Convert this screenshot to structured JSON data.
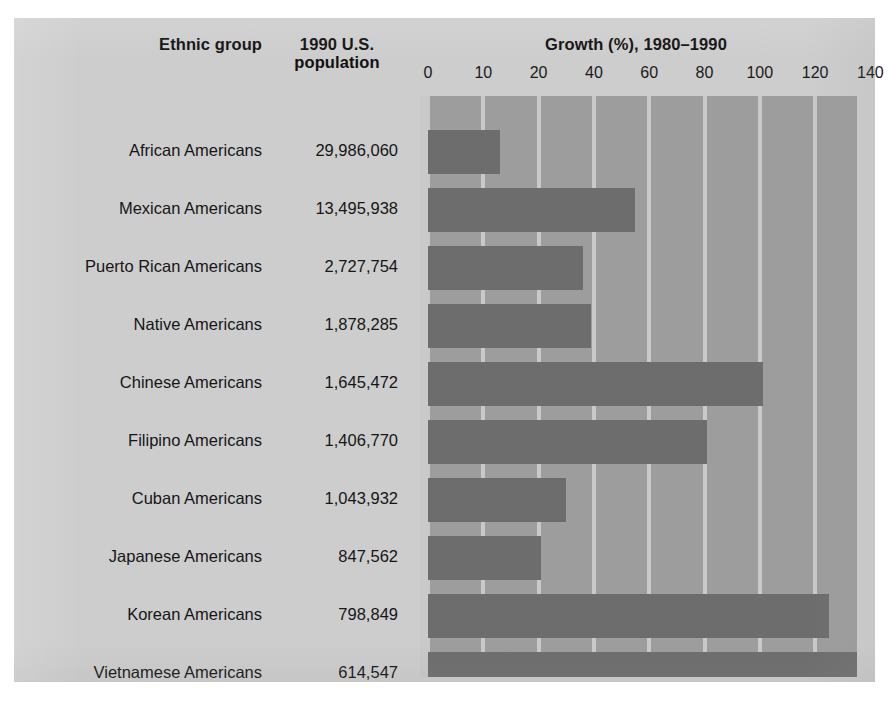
{
  "header": {
    "ethnic_group": "Ethnic group",
    "population": "1990 U.S.\npopulation",
    "population_line1": "1990 U.S.",
    "population_line2": "population",
    "growth_title": "Growth (%), 1980–1990"
  },
  "colors": {
    "panel_background": "#cdcdcd",
    "plot_band": "#9d9d9d",
    "gridline": "#c9c9c9",
    "bar": "#6d6d6d",
    "text": "#161616"
  },
  "rows": [
    {
      "group": "African Americans",
      "population": "29,986,060",
      "growth": 13
    },
    {
      "group": "Mexican Americans",
      "population": "13,495,938",
      "growth": 55
    },
    {
      "group": "Puerto Rican Americans",
      "population": "2,727,754",
      "growth": 36
    },
    {
      "group": "Native Americans",
      "population": "1,878,285",
      "growth": 39
    },
    {
      "group": "Chinese Americans",
      "population": "1,645,472",
      "growth": 101
    },
    {
      "group": "Filipino Americans",
      "population": "1,406,770",
      "growth": 81
    },
    {
      "group": "Cuban Americans",
      "population": "1,043,932",
      "growth": 30
    },
    {
      "group": "Japanese Americans",
      "population": "847,562",
      "growth": 21
    },
    {
      "group": "Korean Americans",
      "population": "798,849",
      "growth": 125
    },
    {
      "group": "Vietnamese Americans",
      "population": "614,547",
      "growth": 135
    }
  ],
  "chart_data": {
    "type": "bar",
    "orientation": "horizontal",
    "title": "Growth (%), 1980–1990",
    "xlabel": "Growth (%), 1980–1990",
    "ylabel": "Ethnic group",
    "categories": [
      "African Americans",
      "Mexican Americans",
      "Puerto Rican Americans",
      "Native Americans",
      "Chinese Americans",
      "Filipino Americans",
      "Cuban Americans",
      "Japanese Americans",
      "Korean Americans",
      "Vietnamese Americans"
    ],
    "values": [
      13,
      55,
      36,
      39,
      101,
      81,
      30,
      21,
      125,
      135
    ],
    "value_unit": "%",
    "secondary_series": {
      "name": "1990 U.S. population",
      "values": [
        29986060,
        13495938,
        2727754,
        1878285,
        1645472,
        1406770,
        1043932,
        847562,
        798849,
        614547
      ],
      "labels": [
        "29,986,060",
        "13,495,938",
        "2,727,754",
        "1,878,285",
        "1,645,472",
        "1,406,770",
        "1,043,932",
        "847,562",
        "798,849",
        "614,547"
      ]
    },
    "xticks": [
      0,
      10,
      20,
      40,
      60,
      80,
      100,
      120,
      140
    ],
    "xtick_labels": [
      "0",
      "10",
      "20",
      "40",
      "60",
      "80",
      "100",
      "120",
      "140"
    ],
    "xtick_spacing": "uniform-pixel (non-linear scale as printed)",
    "xlim": [
      0,
      140
    ],
    "grid": "vertical",
    "legend": "none"
  }
}
